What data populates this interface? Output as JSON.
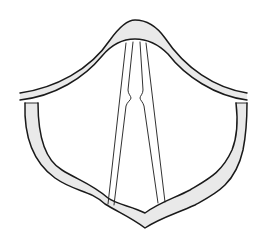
{
  "figure": {
    "title": "",
    "colors": {
      "background": "#ffffff",
      "line": "#1a1a1a",
      "shading": "#cfcfcf"
    },
    "parts": [
      {
        "id": "upper-arch",
        "label": ""
      },
      {
        "id": "left-rim",
        "label": ""
      },
      {
        "id": "right-rim",
        "label": ""
      },
      {
        "id": "lower-rim",
        "label": ""
      },
      {
        "id": "left-vocal-fold",
        "label": ""
      },
      {
        "id": "right-vocal-fold",
        "label": ""
      }
    ]
  }
}
